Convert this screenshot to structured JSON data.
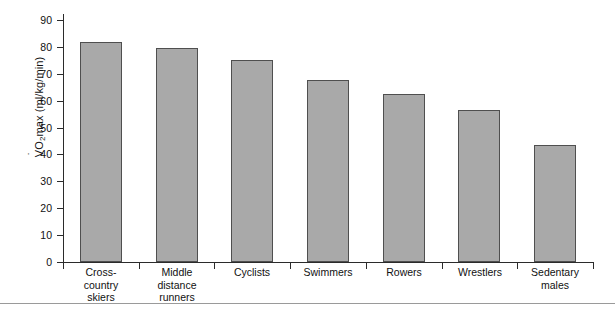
{
  "chart_data": {
    "type": "bar",
    "title": "",
    "subtitle": "",
    "xlabel": "",
    "ylabel": "VO2max (ml/kg/min)",
    "ylabel_parts": {
      "v": "V",
      "o": "O",
      "sub": "2",
      "rest": "max (ml/kg/min)"
    },
    "ylim": [
      0,
      90
    ],
    "yticks": [
      0,
      10,
      20,
      30,
      40,
      50,
      60,
      70,
      80,
      90
    ],
    "ytick_labels": [
      "0",
      "10",
      "20",
      "30",
      "40",
      "50",
      "60",
      "70",
      "80",
      "90"
    ],
    "grid": false,
    "legend": "none",
    "bar_color": "#a9a9a9",
    "bar_edge_color": "#4f4f4f",
    "axis_color": "#2b2b2b",
    "categories": [
      "Cross-country skiers",
      "Middle distance runners",
      "Cyclists",
      "Swimmers",
      "Rowers",
      "Wrestlers",
      "Sedentary males"
    ],
    "category_label_lines": [
      [
        "Cross-",
        "country",
        "skiers"
      ],
      [
        "Middle",
        "distance",
        "runners"
      ],
      [
        "Cyclists"
      ],
      [
        "Swimmers"
      ],
      [
        "Rowers"
      ],
      [
        "Wrestlers"
      ],
      [
        "Sedentary",
        "males"
      ]
    ],
    "values": [
      82,
      79.5,
      75,
      67.5,
      62.5,
      56.5,
      43.5
    ]
  }
}
